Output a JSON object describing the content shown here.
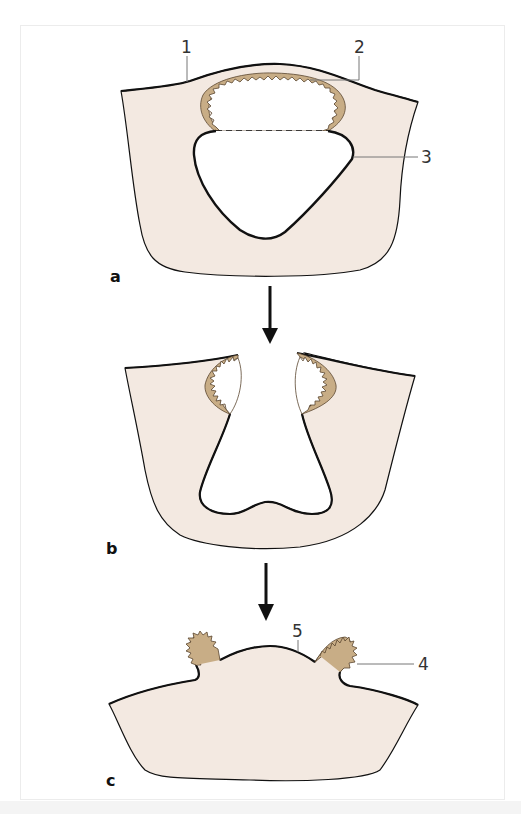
{
  "figure": {
    "panels": [
      {
        "id": "a",
        "label": "a"
      },
      {
        "id": "b",
        "label": "b"
      },
      {
        "id": "c",
        "label": "c"
      }
    ],
    "callouts": [
      {
        "id": "1",
        "label": "1"
      },
      {
        "id": "2",
        "label": "2"
      },
      {
        "id": "3",
        "label": "3"
      },
      {
        "id": "4",
        "label": "4"
      },
      {
        "id": "5",
        "label": "5"
      }
    ],
    "arrows": [
      {
        "from": "a",
        "to": "b",
        "direction": "down"
      },
      {
        "from": "b",
        "to": "c",
        "direction": "down"
      }
    ],
    "colors": {
      "tissue_fill": "#f3e9e1",
      "epithelium_fill": "#c8ad86",
      "outline": "#111111",
      "leader_line": "#777777",
      "background": "#ffffff"
    }
  }
}
